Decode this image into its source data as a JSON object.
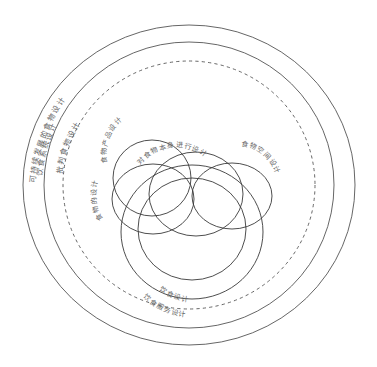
{
  "figure": {
    "type": "concentric-venn-diagram",
    "background_color": "#ffffff",
    "stroke_color": "#555555"
  },
  "rings": [
    {
      "id": "ring-outer",
      "label": "可持续发展的食物设计",
      "style": "solid",
      "level": 1
    },
    {
      "id": "ring-second",
      "label": "饮食系统设计",
      "style": "solid",
      "level": 2
    },
    {
      "id": "ring-third",
      "label": "批判食物设计",
      "style": "dashed",
      "level": 3
    }
  ],
  "inner_circles": [
    {
      "id": "circle-food-product",
      "label": "食物产品设计"
    },
    {
      "id": "circle-food-itself",
      "label": "对食物本身进行设计"
    },
    {
      "id": "circle-food-space",
      "label": "食物空间设计"
    },
    {
      "id": "circle-food-of",
      "label": "食物的设计"
    },
    {
      "id": "circle-dietary",
      "label": "饮食设计"
    },
    {
      "id": "circle-food-service",
      "label": "饮食服务设计"
    }
  ]
}
